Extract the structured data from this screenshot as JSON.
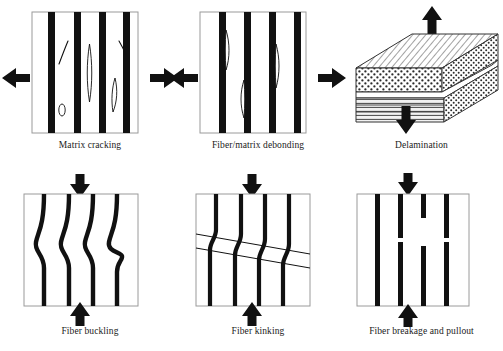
{
  "figure": {
    "background_color": "#ffffff",
    "fiber_color": "#111111",
    "panel_border_color": "#9a9a9a",
    "arrow_color": "#111111"
  },
  "panels": [
    {
      "id": "matrix-cracking",
      "caption": "Matrix cracking",
      "load": "tension",
      "load_direction": "horizontal",
      "arrows": [
        "left",
        "right"
      ],
      "fiber_count": 4,
      "feature": "matrix cracks between fibers",
      "crack_count": 5
    },
    {
      "id": "fiber-matrix-debonding",
      "caption": "Fiber/matrix debonding",
      "load": "tension",
      "load_direction": "horizontal",
      "arrows": [
        "left",
        "right"
      ],
      "fiber_count": 4,
      "feature": "lens shaped debonds along fiber edges",
      "debond_count": 3
    },
    {
      "id": "delamination",
      "caption": "Delamination",
      "load": "through-thickness tension",
      "load_direction": "vertical",
      "arrows": [
        "up",
        "down"
      ],
      "feature": "interlaminar crack between plies",
      "layers": [
        "diagonal ply",
        "speckled ply",
        "delaminated interface",
        "horizontal plies"
      ]
    },
    {
      "id": "fiber-buckling",
      "caption": "Fiber buckling",
      "load": "compression",
      "load_direction": "vertical",
      "arrows": [
        "down",
        "up"
      ],
      "fiber_count": 4,
      "feature": "fibers buckle into S shaped waves"
    },
    {
      "id": "fiber-kinking",
      "caption": "Fiber kinking",
      "load": "compression",
      "load_direction": "vertical",
      "arrows": [
        "down",
        "up"
      ],
      "fiber_count": 4,
      "feature": "inclined kink band rotates fibers"
    },
    {
      "id": "fiber-breakage-and-pullout",
      "caption": "Fiber breakage and pullout",
      "load": "tension",
      "load_direction": "vertical",
      "arrows": [
        "up",
        "down"
      ],
      "fiber_count": 4,
      "feature": "fibers fracture and pull out leaving gaps",
      "break_count": 3
    }
  ]
}
